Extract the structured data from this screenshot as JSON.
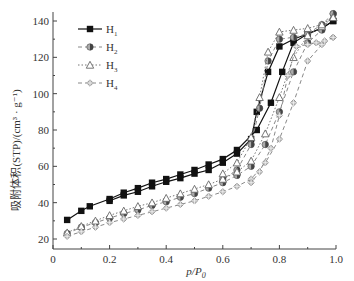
{
  "chart_data": {
    "type": "line",
    "title": "",
    "xlabel": "p/p0",
    "ylabel": "吸附体积(STP)/(cm³ · g⁻¹)",
    "xlim": [
      0,
      1.0
    ],
    "ylim": [
      15,
      145
    ],
    "xticks": [
      "0",
      "0.2",
      "0.4",
      "0.6",
      "0.8",
      "1.0"
    ],
    "yticks": [
      "20",
      "40",
      "60",
      "80",
      "100",
      "120",
      "140"
    ],
    "grid": false,
    "legend_position": "upper-left",
    "series": [
      {
        "name": "H1",
        "marker": "square-filled",
        "line": "solid",
        "adsorption": [
          [
            0.05,
            30.5
          ],
          [
            0.1,
            35.5
          ],
          [
            0.13,
            38
          ],
          [
            0.2,
            42
          ],
          [
            0.25,
            45.5
          ],
          [
            0.3,
            48
          ],
          [
            0.35,
            51
          ],
          [
            0.4,
            53
          ],
          [
            0.45,
            55.5
          ],
          [
            0.5,
            58
          ],
          [
            0.55,
            61
          ],
          [
            0.6,
            64
          ],
          [
            0.65,
            69
          ],
          [
            0.72,
            80
          ],
          [
            0.77,
            95
          ],
          [
            0.81,
            112
          ],
          [
            0.85,
            128
          ],
          [
            0.9,
            133
          ],
          [
            0.95,
            136
          ],
          [
            0.99,
            140
          ]
        ],
        "desorption": [
          [
            0.99,
            140
          ],
          [
            0.95,
            136
          ],
          [
            0.9,
            133
          ],
          [
            0.85,
            130
          ],
          [
            0.8,
            126
          ],
          [
            0.76,
            112
          ],
          [
            0.72,
            90
          ],
          [
            0.7,
            75
          ],
          [
            0.65,
            67
          ],
          [
            0.6,
            62
          ],
          [
            0.55,
            58
          ],
          [
            0.5,
            56
          ],
          [
            0.45,
            53.5
          ],
          [
            0.4,
            51.5
          ],
          [
            0.35,
            49
          ],
          [
            0.3,
            46
          ],
          [
            0.25,
            44
          ],
          [
            0.2,
            41
          ]
        ]
      },
      {
        "name": "H2",
        "marker": "circle-half",
        "line": "dash",
        "adsorption": [
          [
            0.05,
            23
          ],
          [
            0.1,
            26.5
          ],
          [
            0.15,
            29
          ],
          [
            0.2,
            31.5
          ],
          [
            0.25,
            34
          ],
          [
            0.3,
            36
          ],
          [
            0.35,
            38.5
          ],
          [
            0.4,
            40.5
          ],
          [
            0.45,
            43
          ],
          [
            0.5,
            45
          ],
          [
            0.55,
            48
          ],
          [
            0.6,
            51
          ],
          [
            0.65,
            55
          ],
          [
            0.7,
            60
          ],
          [
            0.75,
            72
          ],
          [
            0.8,
            90
          ],
          [
            0.85,
            112
          ],
          [
            0.9,
            128
          ],
          [
            0.95,
            135
          ],
          [
            0.99,
            144
          ]
        ],
        "desorption": [
          [
            0.99,
            144
          ],
          [
            0.95,
            138
          ],
          [
            0.9,
            133
          ],
          [
            0.85,
            131
          ],
          [
            0.8,
            130
          ],
          [
            0.76,
            118
          ],
          [
            0.73,
            92
          ],
          [
            0.7,
            72
          ],
          [
            0.65,
            58
          ],
          [
            0.6,
            53
          ]
        ]
      },
      {
        "name": "H3",
        "marker": "triangle-open",
        "line": "dot",
        "adsorption": [
          [
            0.05,
            23.5
          ],
          [
            0.1,
            27
          ],
          [
            0.15,
            30
          ],
          [
            0.2,
            33
          ],
          [
            0.25,
            35.5
          ],
          [
            0.3,
            38
          ],
          [
            0.35,
            40
          ],
          [
            0.4,
            42.5
          ],
          [
            0.45,
            45
          ],
          [
            0.5,
            47.5
          ],
          [
            0.55,
            50
          ],
          [
            0.6,
            53
          ],
          [
            0.65,
            57
          ],
          [
            0.7,
            63
          ],
          [
            0.75,
            78
          ],
          [
            0.8,
            98
          ],
          [
            0.85,
            120
          ],
          [
            0.9,
            132
          ],
          [
            0.95,
            137
          ],
          [
            0.99,
            142
          ]
        ],
        "desorption": [
          [
            0.99,
            142
          ],
          [
            0.95,
            138
          ],
          [
            0.9,
            136
          ],
          [
            0.85,
            135
          ],
          [
            0.8,
            134
          ],
          [
            0.76,
            123
          ],
          [
            0.73,
            98
          ],
          [
            0.7,
            76
          ],
          [
            0.65,
            62
          ],
          [
            0.6,
            56
          ]
        ]
      },
      {
        "name": "H4",
        "marker": "diamond-cross",
        "line": "dash",
        "adsorption": [
          [
            0.05,
            21.5
          ],
          [
            0.1,
            24
          ],
          [
            0.15,
            26.5
          ],
          [
            0.2,
            29
          ],
          [
            0.25,
            31
          ],
          [
            0.3,
            33
          ],
          [
            0.35,
            35
          ],
          [
            0.4,
            37
          ],
          [
            0.45,
            39
          ],
          [
            0.5,
            41
          ],
          [
            0.55,
            43.5
          ],
          [
            0.6,
            46
          ],
          [
            0.65,
            49
          ],
          [
            0.7,
            53
          ],
          [
            0.75,
            62
          ],
          [
            0.8,
            75
          ],
          [
            0.85,
            95
          ],
          [
            0.9,
            118
          ],
          [
            0.95,
            127
          ],
          [
            0.99,
            131
          ]
        ],
        "desorption": [
          [
            0.99,
            131
          ],
          [
            0.96,
            129
          ],
          [
            0.93,
            128
          ],
          [
            0.9,
            127
          ],
          [
            0.86,
            126
          ],
          [
            0.83,
            110
          ],
          [
            0.8,
            88
          ],
          [
            0.77,
            70
          ],
          [
            0.73,
            57
          ],
          [
            0.7,
            51
          ]
        ]
      }
    ]
  },
  "legend": {
    "items": [
      {
        "label": "H",
        "sub": "1"
      },
      {
        "label": "H",
        "sub": "2"
      },
      {
        "label": "H",
        "sub": "3"
      },
      {
        "label": "H",
        "sub": "4"
      }
    ]
  },
  "axes": {
    "xlabel_main": "p/P",
    "xlabel_sub": "0",
    "ylabel": "吸附体积(STP)/(cm³ · g⁻¹)"
  }
}
